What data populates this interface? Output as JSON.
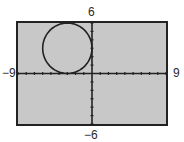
{
  "window": {
    "xmin_label": "−9",
    "xmax_label": "9",
    "ymax_label": "6",
    "ymin_label": "−6"
  },
  "colors": {
    "screen_bg": "#c8c8c8",
    "axis": "#222222",
    "curve": "#222222",
    "page_bg": "#ffffff"
  },
  "chart_data": {
    "type": "line",
    "title": "",
    "equation": "(x+3)^2 + (y-3)^2 = 9",
    "series": [
      {
        "name": "circle",
        "center": [
          -3,
          3
        ],
        "radius": 3
      }
    ],
    "xlim": [
      -9,
      9
    ],
    "ylim": [
      -6,
      6
    ],
    "xscl": 1,
    "yscl": 1,
    "xlabel": "",
    "ylabel": "",
    "tick_labels": {
      "xmin": "−9",
      "xmax": "9",
      "ymin": "−6",
      "ymax": "6"
    },
    "grid": false,
    "legend": "none"
  }
}
